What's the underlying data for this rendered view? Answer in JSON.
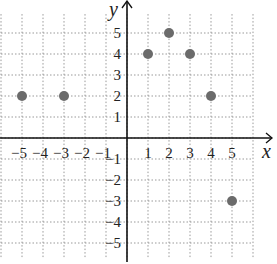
{
  "chart_data": {
    "type": "scatter",
    "title": "",
    "xlabel": "x",
    "ylabel": "y",
    "xlim": [
      -6,
      6
    ],
    "ylim": [
      -6,
      6
    ],
    "grid": true,
    "x_ticks": [
      "-5",
      "-4",
      "-3",
      "-2",
      "-1",
      "1",
      "2",
      "3",
      "4",
      "5"
    ],
    "y_ticks": [
      "5",
      "4",
      "3",
      "2",
      "1",
      "-1",
      "-2",
      "-3",
      "-4",
      "-5"
    ],
    "points": [
      {
        "x": -5,
        "y": 2
      },
      {
        "x": -3,
        "y": 2
      },
      {
        "x": 1,
        "y": 4
      },
      {
        "x": 2,
        "y": 5
      },
      {
        "x": 3,
        "y": 4
      },
      {
        "x": 4,
        "y": 2
      },
      {
        "x": 5,
        "y": -3
      }
    ],
    "point_color": "#6b6b6b"
  }
}
